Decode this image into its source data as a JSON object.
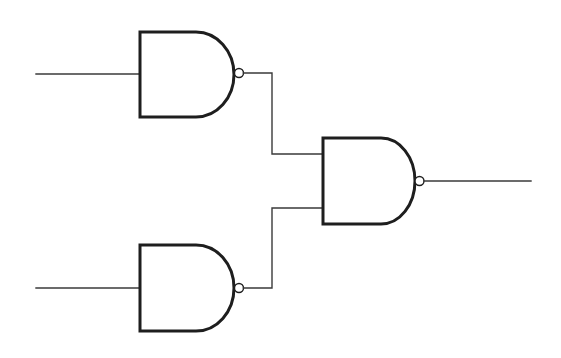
{
  "diagram": {
    "title": "",
    "stroke_color": "#1e1e1e",
    "wire_color": "#3a3a3a",
    "background": "#ffffff",
    "gates": [
      {
        "id": "nand-top",
        "type": "NAND",
        "inputs": 1,
        "label": ""
      },
      {
        "id": "nand-bottom",
        "type": "NAND",
        "inputs": 1,
        "label": ""
      },
      {
        "id": "nand-output",
        "type": "NAND",
        "inputs": 2,
        "label": ""
      }
    ],
    "connections": [
      {
        "from": "input-a",
        "to": "nand-top"
      },
      {
        "from": "input-b",
        "to": "nand-bottom"
      },
      {
        "from": "nand-top",
        "to": "nand-output"
      },
      {
        "from": "nand-bottom",
        "to": "nand-output"
      },
      {
        "from": "nand-output",
        "to": "output"
      }
    ]
  }
}
